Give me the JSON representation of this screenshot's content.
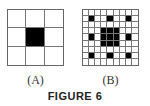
{
  "figure": {
    "caption": "FIGURE 6",
    "panels": [
      {
        "label": "(A)",
        "rows": 3,
        "cols": 3,
        "filled": [
          [
            1,
            1
          ]
        ]
      },
      {
        "label": "(B)",
        "rows": 9,
        "cols": 9,
        "filled": [
          [
            1,
            1
          ],
          [
            1,
            4
          ],
          [
            1,
            7
          ],
          [
            4,
            1
          ],
          [
            4,
            7
          ],
          [
            7,
            1
          ],
          [
            7,
            4
          ],
          [
            7,
            7
          ],
          [
            3,
            3
          ],
          [
            3,
            4
          ],
          [
            3,
            5
          ],
          [
            4,
            3
          ],
          [
            4,
            4
          ],
          [
            4,
            5
          ],
          [
            5,
            3
          ],
          [
            5,
            4
          ],
          [
            5,
            5
          ]
        ]
      }
    ]
  }
}
